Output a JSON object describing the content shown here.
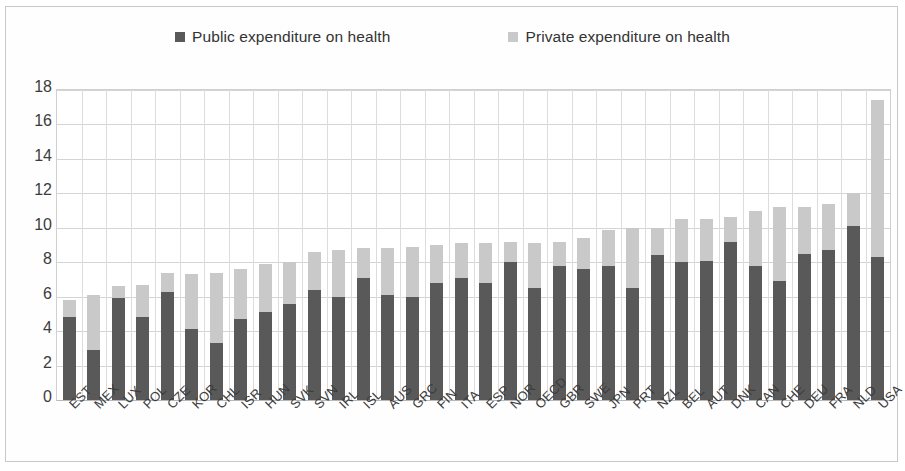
{
  "chart_data": {
    "type": "bar",
    "subtype": "stacked",
    "title": "",
    "xlabel": "",
    "ylabel": "",
    "ylim": [
      0,
      18
    ],
    "ytick_step": 2,
    "yticks": [
      0,
      2,
      4,
      6,
      8,
      10,
      12,
      14,
      16,
      18
    ],
    "grid": true,
    "legend_position": "top",
    "categories": [
      "EST",
      "MEX",
      "LUX",
      "POL",
      "CZE",
      "KOR",
      "CHL",
      "ISR",
      "HUN",
      "SVK",
      "SVN",
      "IRL",
      "ISL",
      "AUS",
      "GRC",
      "FIN",
      "ITA",
      "ESP",
      "NOR",
      "OECD",
      "GBR",
      "SWE",
      "JPN",
      "PRT",
      "NZL",
      "BEL",
      "AUT",
      "DNK",
      "CAN",
      "CHE",
      "DEU",
      "FRA",
      "NLD",
      "USA"
    ],
    "series": [
      {
        "name": "Public expenditure on health",
        "color": "#595959",
        "values": [
          4.8,
          2.9,
          5.9,
          4.8,
          6.3,
          4.1,
          3.3,
          4.7,
          5.1,
          5.6,
          6.4,
          6.0,
          7.1,
          6.1,
          6.0,
          6.8,
          7.1,
          6.8,
          8.0,
          6.5,
          7.8,
          7.6,
          7.8,
          6.5,
          8.4,
          8.0,
          8.1,
          9.2,
          7.8,
          6.9,
          8.5,
          8.7,
          10.1,
          8.3
        ]
      },
      {
        "name": "Private expenditure on health",
        "color": "#c9c9c9",
        "values": [
          1.0,
          3.2,
          0.7,
          1.9,
          1.1,
          3.2,
          4.1,
          2.9,
          2.8,
          2.4,
          2.2,
          2.7,
          1.7,
          2.7,
          2.9,
          2.2,
          2.0,
          2.3,
          1.2,
          2.6,
          1.4,
          1.8,
          2.1,
          3.5,
          1.6,
          2.5,
          2.4,
          1.4,
          3.2,
          4.3,
          2.7,
          2.7,
          1.9,
          9.1
        ]
      }
    ],
    "totals": [
      5.8,
      6.1,
      6.6,
      6.7,
      7.4,
      7.3,
      7.4,
      7.6,
      7.9,
      8.0,
      8.6,
      8.7,
      8.8,
      8.8,
      8.9,
      9.0,
      9.1,
      9.1,
      9.2,
      9.1,
      9.2,
      9.4,
      9.9,
      10.0,
      10.0,
      10.5,
      10.5,
      10.6,
      11.0,
      11.2,
      11.2,
      11.4,
      12.0,
      17.4
    ]
  },
  "legend": {
    "items": [
      {
        "label": "Public expenditure on health",
        "color": "#595959",
        "swatch": "square-swatch-dark"
      },
      {
        "label": "Private expenditure on health",
        "color": "#c9c9c9",
        "swatch": "square-swatch-light"
      }
    ]
  }
}
